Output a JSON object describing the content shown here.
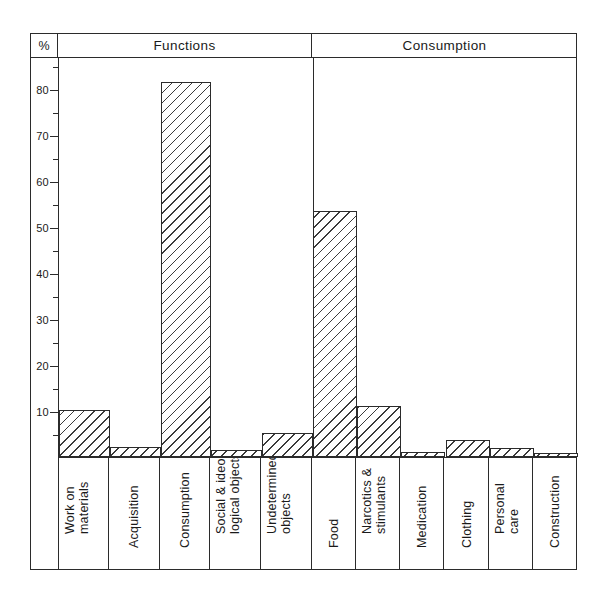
{
  "axis": {
    "unit_label": "%",
    "tick_labels": [
      "80",
      "70",
      "60",
      "50",
      "40",
      "30",
      "20",
      "10"
    ],
    "tick_values": [
      80,
      70,
      60,
      50,
      40,
      30,
      20,
      10
    ],
    "minor_tick_values": [
      85,
      75,
      65,
      55,
      45,
      35,
      25,
      15,
      5
    ],
    "max": 87,
    "min": 0
  },
  "groups": [
    {
      "label": "Functions",
      "span": 5
    },
    {
      "label": "Consumption",
      "span": 6
    }
  ],
  "chart_data": {
    "type": "bar",
    "title": "",
    "subtitle": "",
    "xlabel": "",
    "ylabel": "%",
    "ylim": [
      0,
      87
    ],
    "grid": false,
    "legend": "none",
    "group_headers": [
      "Functions",
      "Consumption"
    ],
    "categories": [
      "Work on materials",
      "Acquisition",
      "Consumption",
      "Social & ideological objects",
      "Undetermined objects",
      "Food",
      "Narcotics & stimulants",
      "Medication",
      "Clothing",
      "Personal care",
      "Construction"
    ],
    "category_lines": [
      [
        "Work on",
        "materials"
      ],
      [
        "Acquisition"
      ],
      [
        "Consumption"
      ],
      [
        "Social & ideo-",
        "logical objects"
      ],
      [
        "Undetermined",
        "objects"
      ],
      [
        "Food"
      ],
      [
        "Narcotics &",
        "stimulants"
      ],
      [
        "Medication"
      ],
      [
        "Clothing"
      ],
      [
        "Personal",
        "care"
      ],
      [
        "Construction"
      ]
    ],
    "category_groups": [
      "Functions",
      "Functions",
      "Functions",
      "Functions",
      "Functions",
      "Consumption",
      "Consumption",
      "Consumption",
      "Consumption",
      "Consumption",
      "Consumption"
    ],
    "values": [
      10.2,
      2.1,
      81.6,
      1.5,
      5.3,
      53.5,
      11.2,
      1.0,
      3.7,
      2.0,
      0.8
    ]
  }
}
